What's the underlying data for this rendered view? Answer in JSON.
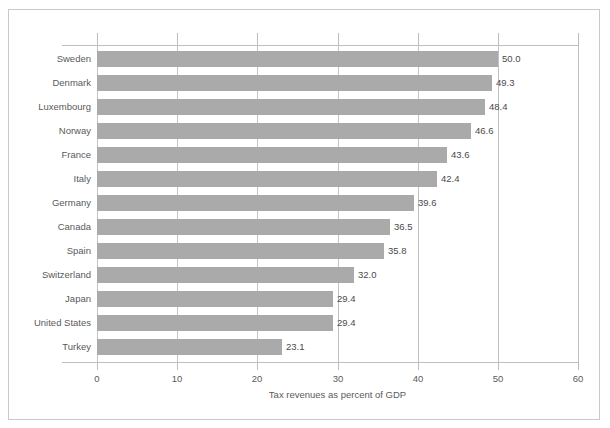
{
  "chart_data": {
    "type": "bar",
    "orientation": "horizontal",
    "title": "",
    "xlabel": "Tax revenues as percent of GDP",
    "ylabel": "",
    "xlim": [
      0,
      60
    ],
    "xticks": [
      0,
      10,
      20,
      30,
      40,
      50,
      60
    ],
    "xtick_labels": [
      "0",
      "10",
      "20",
      "30",
      "40",
      "50",
      "60"
    ],
    "grid": true,
    "grid_axis": "x",
    "legend": false,
    "bar_color": "#aaaaaa",
    "categories": [
      "Sweden",
      "Denmark",
      "Luxembourg",
      "Norway",
      "France",
      "Italy",
      "Germany",
      "Canada",
      "Spain",
      "Switzerland",
      "Japan",
      "United States",
      "Turkey"
    ],
    "values": [
      50.0,
      49.3,
      48.4,
      46.6,
      43.6,
      42.4,
      39.6,
      36.5,
      35.8,
      32.0,
      29.4,
      29.4,
      23.1
    ],
    "value_labels": [
      "50.0",
      "49.3",
      "48.4",
      "46.6",
      "43.6",
      "42.4",
      "39.6",
      "36.5",
      "35.8",
      "32.0",
      "29.4",
      "29.4",
      "23.1"
    ]
  }
}
